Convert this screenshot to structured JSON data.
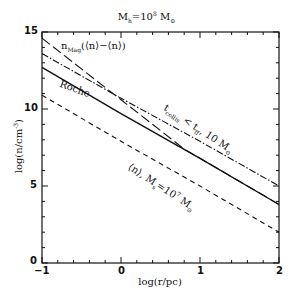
{
  "chart_data": {
    "type": "line",
    "xlabel": "log(r/pc)",
    "ylabel": "log(n/cm^-3)",
    "xlim": [
      -1,
      2
    ],
    "ylim": [
      0,
      15
    ],
    "xticks": [
      -1,
      0,
      1,
      2
    ],
    "yticks": [
      0,
      5,
      10,
      15
    ],
    "grid": false,
    "legend": "inline annotations",
    "series": [
      {
        "name": "n_Mag(⟨n⟩−⟨n⟩)",
        "style": "long-dash",
        "x": [
          -1,
          0,
          0.8,
          1,
          2
        ],
        "y": [
          14.6,
          10.6,
          7.4,
          6.8,
          3.8
        ]
      },
      {
        "name": "t_collis < t_ff, 10 M_⊙",
        "style": "dash-dot",
        "x": [
          -1,
          0,
          1,
          2
        ],
        "y": [
          13.6,
          10.7,
          7.9,
          5.0
        ]
      },
      {
        "name": "Roche",
        "style": "solid",
        "x": [
          -1,
          0,
          1,
          2
        ],
        "y": [
          12.7,
          9.7,
          6.8,
          3.8
        ]
      },
      {
        "name": "⟨n⟩, M_s=10^7 M_⊙",
        "style": "dashed",
        "x": [
          -1,
          0,
          1,
          2
        ],
        "y": [
          10.9,
          7.9,
          5.0,
          2.0
        ]
      }
    ]
  },
  "labels": {
    "title_main": "M",
    "title_sub": "h",
    "title_eq": "=10",
    "title_sup": "8",
    "title_unit": " M",
    "title_unit_sub": "⊙",
    "xlabel": "log(r/pc)",
    "ylabel_main": "log(n/cm",
    "ylabel_sup": "-3",
    "ylabel_end": ")",
    "xtick_0": "−1",
    "xtick_1": "0",
    "xtick_2": "1",
    "xtick_3": "2",
    "ytick_0": "0",
    "ytick_1": "5",
    "ytick_2": "10",
    "ytick_3": "15",
    "anno_nmag": "n",
    "anno_nmag_sub": "Mag",
    "anno_nmag_rest": "(⟨n⟩−⟨n⟩)",
    "anno_roche": "Roche",
    "anno_tcoll": "t",
    "anno_tcoll_sub": "collis",
    "anno_tcoll_mid": " < t",
    "anno_tcoll_sub2": "ff",
    "anno_tcoll_rest": ", 10 M",
    "anno_tcoll_sun": "⊙",
    "anno_avg": "⟨n⟩, M",
    "anno_avg_sub": "s",
    "anno_avg_eq": "=10",
    "anno_avg_sup": "7",
    "anno_avg_unit": " M",
    "anno_avg_sun": "⊙"
  }
}
